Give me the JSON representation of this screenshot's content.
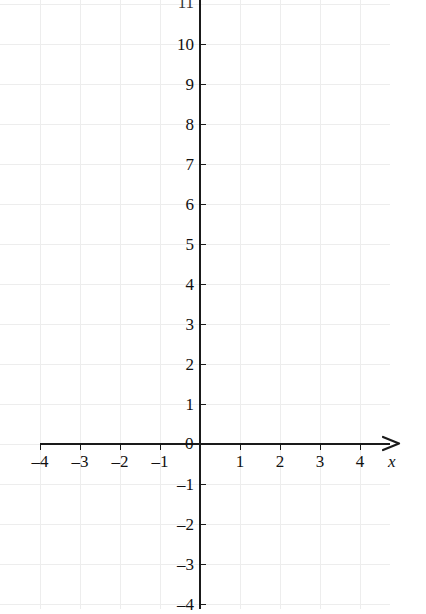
{
  "chart_data": {
    "type": "scatter",
    "title": "",
    "subtitle": "",
    "xlabel": "x",
    "ylabel": "",
    "xlim": [
      -4,
      4.6
    ],
    "ylim": [
      -4,
      11
    ],
    "x_ticks": [
      -4,
      -3,
      -2,
      -1,
      1,
      2,
      3,
      4
    ],
    "x_tick_labels": [
      "–4",
      "–3",
      "–2",
      "–1",
      "1",
      "2",
      "3",
      "4"
    ],
    "y_ticks": [
      -4,
      -3,
      -2,
      -1,
      1,
      2,
      3,
      4,
      5,
      6,
      7,
      8,
      9,
      10
    ],
    "y_tick_labels": [
      "–4",
      "–3",
      "–2",
      "–1",
      "1",
      "2",
      "3",
      "4",
      "5",
      "6",
      "7",
      "8",
      "9",
      "10"
    ],
    "origin_label": "0",
    "clipped_top_label": "11",
    "grid": true,
    "grid_color": "#ededed",
    "axis_color": "#1a1a1a",
    "series": [],
    "values": [],
    "categories": [],
    "legend": [],
    "annotations": [],
    "x_axis_arrow": true,
    "y_axis_arrow": false
  },
  "geometry": {
    "origin_px": {
      "x": 200,
      "y": 444
    },
    "unit_px": 40,
    "x_axis": {
      "start_px": 40,
      "end_px": 396
    },
    "y_axis": {
      "top_px": 0,
      "bottom_px": 609
    },
    "grid_right_px": 390
  },
  "axis_label_x": "x"
}
